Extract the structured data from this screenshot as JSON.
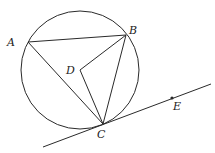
{
  "diagram": {
    "circle": {
      "cx": 80,
      "cy": 70,
      "r": 59
    },
    "points": {
      "A": {
        "x": 28,
        "y": 42,
        "label": "A",
        "lx": 7,
        "ly": 46
      },
      "B": {
        "x": 126,
        "y": 35,
        "label": "B",
        "lx": 129,
        "ly": 34
      },
      "C": {
        "x": 103,
        "y": 124,
        "label": "C",
        "lx": 97,
        "ly": 138
      },
      "D": {
        "x": 80,
        "y": 70,
        "label": "D",
        "lx": 66,
        "ly": 74
      },
      "E": {
        "x": 172,
        "y": 98,
        "label": "E",
        "lx": 173,
        "ly": 110
      }
    },
    "tangent_line": {
      "x1": 43,
      "y1": 147,
      "x2": 211,
      "y2": 84
    },
    "colors": {
      "stroke": "#2a2a2a",
      "background": "#ffffff"
    }
  }
}
